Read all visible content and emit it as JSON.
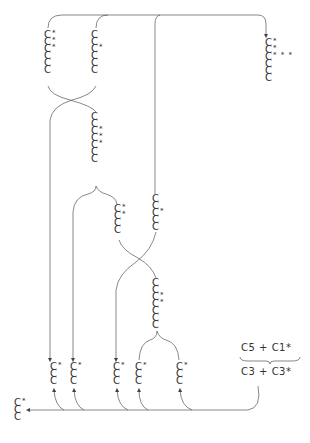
{
  "figure": {
    "equation": {
      "top_left": "C5",
      "top_op": "+",
      "top_right": "C1*",
      "bottom_left": "C3",
      "bottom_op": "+",
      "bottom_right": "C3*"
    },
    "chains": [
      {
        "id": "top-left",
        "x": 44,
        "y": 32,
        "length": 6,
        "stars": {
          "0": "*",
          "1": "*",
          "2": "*"
        }
      },
      {
        "id": "top-middle",
        "x": 91,
        "y": 32,
        "length": 6,
        "stars": {
          "2": "*"
        }
      },
      {
        "id": "top-right-product",
        "x": 265,
        "y": 40,
        "length": 6,
        "stars": {
          "0": "*",
          "1": "*",
          "2": "* * *"
        }
      },
      {
        "id": "middle-seven",
        "x": 91,
        "y": 114,
        "length": 7,
        "stars": {
          "2": "*",
          "3": "*",
          "4": "*"
        }
      },
      {
        "id": "middle-four",
        "x": 114,
        "y": 206,
        "length": 4,
        "stars": {
          "0": "*",
          "1": "*"
        }
      },
      {
        "id": "middle-five",
        "x": 152,
        "y": 196,
        "length": 5,
        "stars": {
          "2": "*"
        }
      },
      {
        "id": "lower-seven",
        "x": 152,
        "y": 280,
        "length": 7,
        "stars": {
          "2": "*",
          "3": "*"
        }
      },
      {
        "id": "bottom-1",
        "x": 50,
        "y": 364,
        "length": 3,
        "stars": {
          "0": "*"
        }
      },
      {
        "id": "bottom-2",
        "x": 70,
        "y": 364,
        "length": 3,
        "stars": {
          "0": "*"
        }
      },
      {
        "id": "bottom-3",
        "x": 113,
        "y": 364,
        "length": 3,
        "stars": {
          "0": "*"
        }
      },
      {
        "id": "bottom-4",
        "x": 135,
        "y": 364,
        "length": 3,
        "stars": {
          "0": "*"
        }
      },
      {
        "id": "bottom-5",
        "x": 176,
        "y": 364,
        "length": 3,
        "stars": {
          "0": "*"
        }
      },
      {
        "id": "final-three",
        "x": 14,
        "y": 400,
        "length": 3,
        "stars": {
          "0": "*"
        }
      }
    ],
    "carbon_symbol": "C",
    "line_color": "#555555"
  }
}
